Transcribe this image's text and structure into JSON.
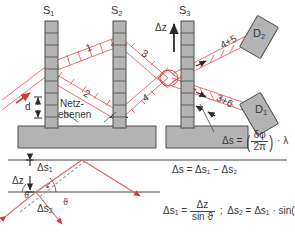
{
  "figure": {
    "type": "neutron-interferometer-diagram",
    "language": "de",
    "colors": {
      "beam": "#e8635c",
      "beam_dark": "#d13b33",
      "crystal_fill": "#b3b3b3",
      "crystal_stroke": "#4d4d4d",
      "text": "#3a3a3a",
      "rule": "#808080",
      "background": "#ffffff"
    }
  },
  "crystals": {
    "labels": [
      "S",
      "S",
      "S"
    ],
    "indices": [
      "1",
      "2",
      "3"
    ],
    "s1": "S",
    "s1_idx": "1",
    "s2": "S",
    "s2_idx": "2",
    "s3": "S",
    "s3_idx": "3"
  },
  "detectors": {
    "upper": {
      "label": "D",
      "index": "2"
    },
    "lower": {
      "label": "D",
      "index": "1"
    }
  },
  "beam_paths": {
    "p1": "1",
    "p2": "2",
    "p3": "3",
    "p4": "4",
    "upper_out": "4+5",
    "lower_out": "3+6"
  },
  "annotations": {
    "delta_z_top": "Δz",
    "lattice_planes": "Netz-",
    "lattice_planes2": "ebenen",
    "spacing_d": "d"
  },
  "formulas": {
    "ds_phase": {
      "lhs": "Δs",
      "eq": "=",
      "num": "δφ",
      "den": "2π",
      "dot": "·",
      "lambda": "λ"
    },
    "ds_diff": "Δs = Δs₁ − Δs₂",
    "ds1": {
      "lhs": "Δs",
      "lhs_idx": "1",
      "eq": "=",
      "num": "Δz",
      "den": "sin ϑ"
    },
    "separator": ";",
    "ds2": {
      "lhs": "Δs",
      "lhs_idx": "2",
      "eq": "=",
      "rhs": "Δs",
      "rhs_idx": "1",
      "dot": "·",
      "trig": "sin(90°−2ϑ)"
    }
  },
  "geometry_inset": {
    "ds1": "Δs",
    "ds1_idx": "1",
    "dz": "Δz",
    "ds2": "Δs",
    "ds2_idx": "2",
    "theta_left": "ϑ",
    "theta_right": "ϑ"
  }
}
